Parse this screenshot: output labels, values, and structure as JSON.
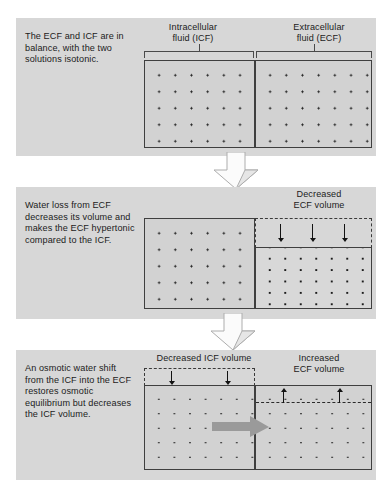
{
  "figure": {
    "background_color": "#ffffff",
    "panel_color": "#d7d7d7",
    "box_fill_color": "#d2d2d2",
    "box_border_color": "#3f3f3f",
    "dot_color": "#1c1c1c",
    "gray_arrow_color": "#9a9a9a"
  },
  "panels": [
    {
      "id": "panel-1",
      "caption": "The ECF and ICF are in balance, with the two solutions isotonic.",
      "labels": {
        "icf": "Intracellular\nfluid (ICF)",
        "ecf": "Extracellular\nfluid (ECF)"
      },
      "compartments": [
        {
          "name": "ICF",
          "dot_rows": 5,
          "dot_cols": 8,
          "state": "normal"
        },
        {
          "name": "ECF",
          "dot_rows": 5,
          "dot_cols": 5,
          "state": "normal"
        }
      ]
    },
    {
      "id": "panel-2",
      "caption": "Water loss from ECF decreases its volume and makes the ECF hypertonic compared to the ICF.",
      "labels": {
        "decreased_ecf": "Decreased\nECF volume"
      },
      "compartments": [
        {
          "name": "ICF",
          "dot_rows": 5,
          "dot_cols": 8,
          "state": "normal"
        },
        {
          "name": "ECF",
          "dot_rows": 6,
          "dot_cols": 5,
          "state": "shrunken-hypertonic"
        }
      ],
      "arrow_count_down": 3
    },
    {
      "id": "panel-3",
      "caption": "An osmotic water shift from the ICF into the ECF restores osmotic equilibrium but decreases the ICF volume.",
      "labels": {
        "decreased_icf": "Decreased ICF volume",
        "increased_ecf": "Increased\nECF volume"
      },
      "compartments": [
        {
          "name": "ICF",
          "dot_rows": 5,
          "dot_cols": 8,
          "state": "shrunken"
        },
        {
          "name": "ECF",
          "dot_rows": 5,
          "dot_cols": 5,
          "state": "expanded"
        }
      ],
      "arrow_count_down": 2,
      "arrow_count_up": 2,
      "shift_arrow_direction": "right"
    }
  ],
  "flow_arrows": [
    {
      "name": "panel-1-to-2",
      "direction": "down"
    },
    {
      "name": "panel-2-to-3",
      "direction": "down"
    }
  ]
}
